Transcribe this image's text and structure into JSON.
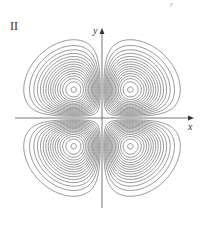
{
  "figure": {
    "panel_label": "II",
    "corner_mark": "y",
    "x_axis_label": "x",
    "y_axis_label": "y",
    "colors": {
      "lines": "#444444",
      "axes": "#555555",
      "background": "#ffffff"
    }
  },
  "chart_data": {
    "type": "contour",
    "title": "II",
    "xlabel": "x",
    "ylabel": "y",
    "function": "x*y*exp(-(x^2+y^2))",
    "lobe_centers_px": [
      [
        74,
        90
      ],
      [
        131,
        90
      ],
      [
        74,
        147
      ],
      [
        131,
        147
      ]
    ],
    "contours_per_lobe": 16,
    "origin_px": [
      102,
      118
    ],
    "x_axis_px": [
      15,
      194
    ],
    "y_axis_px": [
      28,
      208
    ],
    "grid": false,
    "legend": false
  }
}
